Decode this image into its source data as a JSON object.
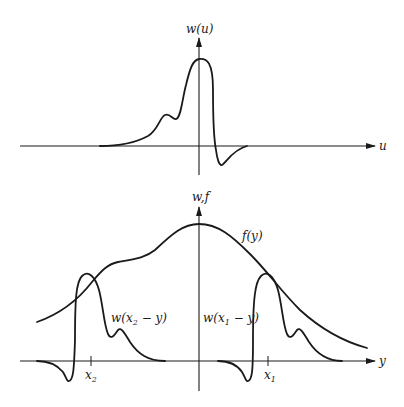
{
  "top_panel": {
    "y_axis_label": "w(u)",
    "x_axis_label": "u",
    "curve_name": "w(u)"
  },
  "bottom_panel": {
    "y_axis_label": "w,f",
    "x_axis_label": "y",
    "f_label": "f(y)",
    "w2_label": {
      "prefix": "w(x",
      "sub": "2",
      "suffix": " − y)"
    },
    "w1_label": {
      "prefix": "w(x",
      "sub": "1",
      "suffix": " − y)"
    },
    "tick_x2": {
      "base": "x",
      "sub": "2"
    },
    "tick_x1": {
      "base": "x",
      "sub": "1"
    }
  },
  "colors": {
    "ink": "#1a1a1a",
    "background": "#ffffff"
  }
}
